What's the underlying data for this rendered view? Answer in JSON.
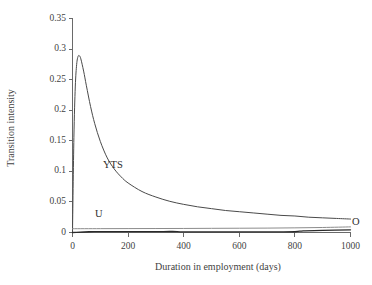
{
  "chart_data": {
    "type": "line",
    "title": "",
    "xlabel": "Duration in employment (days)",
    "ylabel": "Transition intensity",
    "xlim": [
      0,
      1000
    ],
    "ylim": [
      0,
      0.35
    ],
    "xticks": [
      0,
      200,
      400,
      600,
      800,
      1000
    ],
    "xtick_labels": [
      "0",
      "200",
      "400",
      "600",
      "800",
      "1000"
    ],
    "yticks": [
      0,
      0.05,
      0.1,
      0.15,
      0.2,
      0.25,
      0.3,
      0.35
    ],
    "ytick_labels": [
      "0",
      "0.05",
      "0.1",
      "0.15",
      "0.2",
      "0.25",
      "0.3",
      "0.35"
    ],
    "grid": false,
    "legend_position": "inline-annotations",
    "annotations": [
      {
        "text": "YTS",
        "x": 150,
        "y": 0.108
      },
      {
        "text": "U",
        "x": 105,
        "y": 0.028
      },
      {
        "text": "O",
        "x": 1020,
        "y": 0.014
      }
    ],
    "series": [
      {
        "name": "YTS",
        "color": "#4a4a4a",
        "x": [
          0,
          5,
          10,
          15,
          20,
          25,
          30,
          40,
          50,
          65,
          80,
          100,
          125,
          150,
          175,
          200,
          250,
          300,
          350,
          400,
          450,
          500,
          550,
          600,
          650,
          700,
          750,
          800,
          850,
          900,
          950,
          1000
        ],
        "y": [
          0.0,
          0.155,
          0.238,
          0.275,
          0.288,
          0.289,
          0.284,
          0.264,
          0.24,
          0.206,
          0.178,
          0.149,
          0.122,
          0.104,
          0.091,
          0.081,
          0.067,
          0.058,
          0.051,
          0.046,
          0.042,
          0.039,
          0.036,
          0.034,
          0.032,
          0.03,
          0.028,
          0.027,
          0.025,
          0.024,
          0.023,
          0.022
        ]
      },
      {
        "name": "O",
        "color": "#8c8c8c",
        "x": [
          0,
          100,
          200,
          300,
          400,
          500,
          600,
          700,
          800,
          900,
          1000
        ],
        "y": [
          0.0062,
          0.0063,
          0.0064,
          0.0065,
          0.0066,
          0.0068,
          0.007,
          0.0072,
          0.0076,
          0.0082,
          0.0092
        ]
      },
      {
        "name": "U",
        "color": "#2a2a2a",
        "x": [
          0,
          60,
          100,
          200,
          300,
          360,
          400,
          500,
          600,
          700,
          800,
          830,
          900,
          1000
        ],
        "y": [
          0.0,
          0.0012,
          0.0013,
          0.0014,
          0.0015,
          0.0016,
          0.0009,
          0.0009,
          0.001,
          0.0011,
          0.0012,
          0.0028,
          0.0034,
          0.0044
        ]
      }
    ]
  },
  "axis": {
    "line_color": "#6a6a6a"
  }
}
